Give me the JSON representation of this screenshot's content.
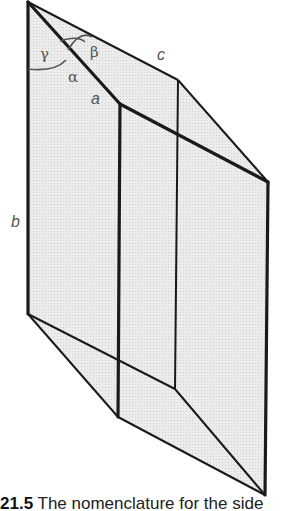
{
  "figure": {
    "number": "21.5",
    "caption": "The nomenclature for the side"
  },
  "labels": {
    "a": "a",
    "b": "b",
    "c": "c",
    "alpha": "α",
    "beta": "β",
    "gamma": "γ"
  },
  "colors": {
    "fill": "#e6e6e6",
    "edge": "#1a1a1a",
    "label": "#555555"
  }
}
